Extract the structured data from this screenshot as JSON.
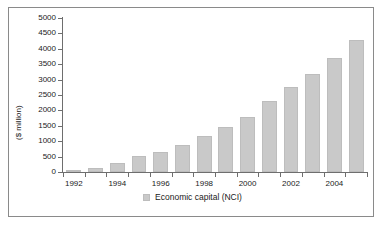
{
  "chart_data": {
    "type": "bar",
    "title": "",
    "subtitle": "",
    "xlabel": "",
    "ylabel": "($ million)",
    "categories": [
      "1992",
      "1993",
      "1994",
      "1995",
      "1996",
      "1997",
      "1998",
      "1999",
      "2000",
      "2001",
      "2002",
      "2003",
      "2004",
      "2005"
    ],
    "tick_labels_x": [
      "1992",
      "1994",
      "1996",
      "1998",
      "2000",
      "2002",
      "2004"
    ],
    "tick_labels_y": [
      "0",
      "500",
      "1000",
      "1500",
      "2000",
      "2500",
      "3000",
      "3500",
      "4000",
      "4500",
      "5000"
    ],
    "values": [
      60,
      140,
      300,
      520,
      640,
      870,
      1170,
      1460,
      1790,
      2300,
      2770,
      3180,
      3700,
      4280
    ],
    "series": [
      {
        "name": "Economic capital (NCI)",
        "values": [
          60,
          140,
          300,
          520,
          640,
          870,
          1170,
          1460,
          1790,
          2300,
          2770,
          3180,
          3700,
          4280
        ],
        "color": "#c9c9c9"
      }
    ],
    "ylim": [
      0,
      5000
    ],
    "ytick_step": 500,
    "grid": false,
    "legend_position": "bottom"
  },
  "legend": {
    "label": "Economic capital (NCI)",
    "swatch_name": "legend-swatch-economic-capital"
  },
  "axes": {
    "y_title": "($ million)"
  }
}
